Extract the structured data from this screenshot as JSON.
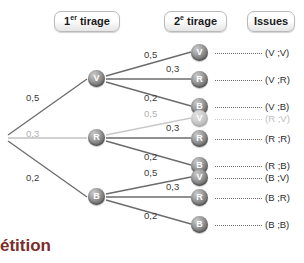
{
  "headers": [
    {
      "name": "first-draw",
      "prefix": "1",
      "sup": "er",
      "rest": " tirage",
      "full": "1er tirage"
    },
    {
      "name": "second-draw",
      "prefix": "2",
      "sup": "e",
      "rest": " tirage",
      "full": "2e tirage"
    },
    {
      "name": "outcomes",
      "prefix": "",
      "sup": "",
      "rest": "Issues",
      "full": "Issues"
    }
  ],
  "tree": {
    "root_label": "",
    "level1": [
      {
        "letter": "V",
        "prob": "0,5",
        "faded": false
      },
      {
        "letter": "R",
        "prob": "0,3",
        "faded": true
      },
      {
        "letter": "B",
        "prob": "0,2",
        "faded": false
      }
    ],
    "branches": [
      {
        "parent": "V",
        "leaves": [
          {
            "letter": "V",
            "prob": "0,5",
            "issue": "(V ;V)",
            "faded": false
          },
          {
            "letter": "R",
            "prob": "0,3",
            "issue": "(V ;R)",
            "faded": false
          },
          {
            "letter": "B",
            "prob": "0,2",
            "issue": "(V ;B)",
            "faded": false
          }
        ]
      },
      {
        "parent": "R",
        "leaves": [
          {
            "letter": "V",
            "prob": "0,5",
            "issue": "(R ;V)",
            "faded": true
          },
          {
            "letter": "R",
            "prob": "0,3",
            "issue": "(R ;R)",
            "faded": false
          },
          {
            "letter": "B",
            "prob": "0,2",
            "issue": "(R ;B)",
            "faded": false
          }
        ]
      },
      {
        "parent": "B",
        "leaves": [
          {
            "letter": "V",
            "prob": "0,5",
            "issue": "(B ;V)",
            "faded": false
          },
          {
            "letter": "R",
            "prob": "0,3",
            "issue": "(B ;R)",
            "faded": false
          },
          {
            "letter": "B",
            "prob": "0,2",
            "issue": "(B ;B)",
            "faded": false
          }
        ]
      }
    ]
  },
  "footer": {
    "text": "étition"
  },
  "colors": {
    "footer_text": "#7b2d2a",
    "node_fill": "#6e6e6e",
    "node_faded_fill": "#bdbdbd",
    "line": "#6b6b6b",
    "line_faded": "#c8c8c8"
  }
}
